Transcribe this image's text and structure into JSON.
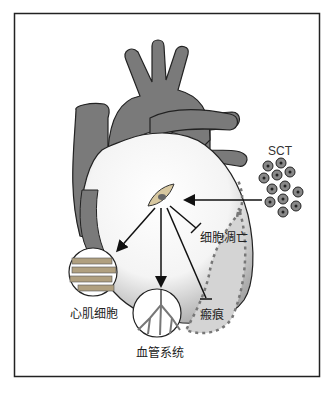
{
  "figure": {
    "labels": {
      "sct": "SCT",
      "apoptosis": "细胞凋亡",
      "cardiomyocytes": "心肌细胞",
      "vasculature": "血管系统",
      "scar": "瘢痕"
    },
    "colors": {
      "border": "#222222",
      "heart_vessels": "#7a7a7a",
      "heart_body_light": "#ffffff",
      "heart_body_dark": "#9a9a9a",
      "scar_fill": "#cfcfcf",
      "scar_dash": "#777777",
      "arrow": "#111111",
      "vessel_red": "#8a8a8a"
    }
  }
}
